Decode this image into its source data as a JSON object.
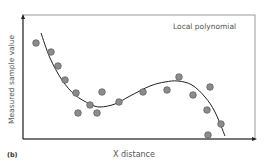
{
  "chart_data": {
    "type": "scatter",
    "title": "Local polynomial",
    "panel_label": "(b)",
    "xlabel": "X distance",
    "ylabel": "Measured sample value",
    "grid": false,
    "axis_ticks": false,
    "series": [
      {
        "name": "Measured samples",
        "kind": "scatter",
        "color": "#8c8c8c",
        "points": [
          [
            36,
            43
          ],
          [
            51,
            52
          ],
          [
            58,
            66
          ],
          [
            65,
            80
          ],
          [
            76,
            93
          ],
          [
            78,
            113
          ],
          [
            90,
            105
          ],
          [
            97,
            113
          ],
          [
            102,
            92
          ],
          [
            119,
            102
          ],
          [
            143,
            92
          ],
          [
            167,
            90
          ],
          [
            179,
            77
          ],
          [
            193,
            95
          ],
          [
            210,
            87
          ],
          [
            207,
            110
          ],
          [
            208,
            135
          ],
          [
            221,
            124
          ]
        ]
      },
      {
        "name": "Local polynomial fit",
        "kind": "line",
        "color": "#222222",
        "points": [
          [
            41,
            33
          ],
          [
            50,
            58
          ],
          [
            62,
            80
          ],
          [
            75,
            95
          ],
          [
            90,
            104
          ],
          [
            100,
            107
          ],
          [
            115,
            104
          ],
          [
            130,
            96
          ],
          [
            150,
            86
          ],
          [
            165,
            82
          ],
          [
            178,
            81
          ],
          [
            192,
            85
          ],
          [
            205,
            97
          ],
          [
            215,
            112
          ],
          [
            225,
            136
          ]
        ]
      }
    ],
    "colors": {
      "marker_fill": "#8c8c8c",
      "marker_stroke": "#5a5a5a",
      "curve": "#222222",
      "axis": "#222222",
      "frame": "#9a9a9a"
    }
  }
}
